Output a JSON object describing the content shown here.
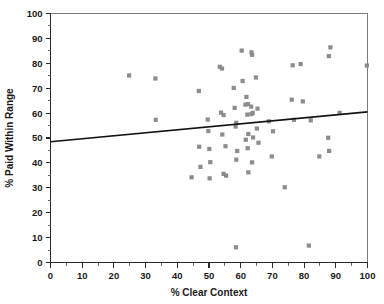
{
  "chart_data": {
    "type": "scatter",
    "title": "",
    "xlabel": "% Clear Context",
    "ylabel": "% Paid Within Range",
    "xlim": [
      0,
      100
    ],
    "ylim": [
      0,
      100
    ],
    "xticks": [
      0,
      10,
      20,
      30,
      40,
      50,
      60,
      70,
      80,
      90,
      100
    ],
    "yticks": [
      0,
      10,
      20,
      30,
      40,
      50,
      60,
      70,
      80,
      90,
      100
    ],
    "xtick_labels": [
      "0",
      "10",
      "20",
      "30",
      "40",
      "50",
      "60",
      "70",
      "80",
      "90",
      "100"
    ],
    "ytick_labels": [
      "0",
      "10",
      "20",
      "30",
      "40",
      "50",
      "60",
      "70",
      "80",
      "90",
      "100"
    ],
    "grid": false,
    "legend": null,
    "marker_color": "#8c8c8c",
    "marker_shape": "square",
    "trend_line": {
      "name": "linear fit",
      "color": "#111111",
      "x": [
        0,
        100
      ],
      "y": [
        48.5,
        60.5
      ]
    },
    "points": [
      {
        "x": 24.8,
        "y": 75.1
      },
      {
        "x": 33.1,
        "y": 73.9
      },
      {
        "x": 33.2,
        "y": 57.3
      },
      {
        "x": 44.5,
        "y": 34.2
      },
      {
        "x": 46.8,
        "y": 68.9
      },
      {
        "x": 46.9,
        "y": 46.5
      },
      {
        "x": 47.3,
        "y": 38.4
      },
      {
        "x": 49.6,
        "y": 57.4
      },
      {
        "x": 49.8,
        "y": 52.8
      },
      {
        "x": 50.1,
        "y": 45.6
      },
      {
        "x": 50.4,
        "y": 40.3
      },
      {
        "x": 50.2,
        "y": 33.8
      },
      {
        "x": 53.4,
        "y": 78.6
      },
      {
        "x": 54.1,
        "y": 77.9
      },
      {
        "x": 53.8,
        "y": 60.2
      },
      {
        "x": 54.6,
        "y": 59.2
      },
      {
        "x": 54.2,
        "y": 51.4
      },
      {
        "x": 55.2,
        "y": 46.7
      },
      {
        "x": 54.6,
        "y": 35.6
      },
      {
        "x": 55.4,
        "y": 34.9
      },
      {
        "x": 57.8,
        "y": 70.1
      },
      {
        "x": 58.1,
        "y": 62.1
      },
      {
        "x": 58.6,
        "y": 56.1
      },
      {
        "x": 58.4,
        "y": 54.6
      },
      {
        "x": 58.9,
        "y": 44.8
      },
      {
        "x": 58.6,
        "y": 41.3
      },
      {
        "x": 58.5,
        "y": 6.1
      },
      {
        "x": 60.3,
        "y": 85.1
      },
      {
        "x": 60.6,
        "y": 72.9
      },
      {
        "x": 61.8,
        "y": 66.5
      },
      {
        "x": 61.5,
        "y": 63.4
      },
      {
        "x": 62.3,
        "y": 63.6
      },
      {
        "x": 62.1,
        "y": 59.4
      },
      {
        "x": 62.4,
        "y": 51.6
      },
      {
        "x": 61.6,
        "y": 49.3
      },
      {
        "x": 62.2,
        "y": 45.9
      },
      {
        "x": 62.4,
        "y": 36.2
      },
      {
        "x": 63.4,
        "y": 84.4
      },
      {
        "x": 63.6,
        "y": 83.4
      },
      {
        "x": 63.3,
        "y": 62.6
      },
      {
        "x": 63.8,
        "y": 60.1
      },
      {
        "x": 63.4,
        "y": 59.6
      },
      {
        "x": 63.9,
        "y": 50.2
      },
      {
        "x": 63.6,
        "y": 40.2
      },
      {
        "x": 64.8,
        "y": 74.3
      },
      {
        "x": 65.3,
        "y": 61.8
      },
      {
        "x": 65.1,
        "y": 53.8
      },
      {
        "x": 65.6,
        "y": 48.1
      },
      {
        "x": 68.9,
        "y": 56.7
      },
      {
        "x": 69.8,
        "y": 42.6
      },
      {
        "x": 70.2,
        "y": 52.7
      },
      {
        "x": 73.9,
        "y": 30.2
      },
      {
        "x": 76.4,
        "y": 79.2
      },
      {
        "x": 76.1,
        "y": 65.4
      },
      {
        "x": 76.8,
        "y": 57.3
      },
      {
        "x": 78.9,
        "y": 79.7
      },
      {
        "x": 79.6,
        "y": 64.7
      },
      {
        "x": 81.5,
        "y": 6.8
      },
      {
        "x": 82.1,
        "y": 57.1
      },
      {
        "x": 84.8,
        "y": 42.6
      },
      {
        "x": 87.6,
        "y": 50.1
      },
      {
        "x": 87.9,
        "y": 44.8
      },
      {
        "x": 87.8,
        "y": 82.9
      },
      {
        "x": 88.3,
        "y": 86.4
      },
      {
        "x": 91.2,
        "y": 60.1
      },
      {
        "x": 99.8,
        "y": 79.1
      }
    ]
  }
}
